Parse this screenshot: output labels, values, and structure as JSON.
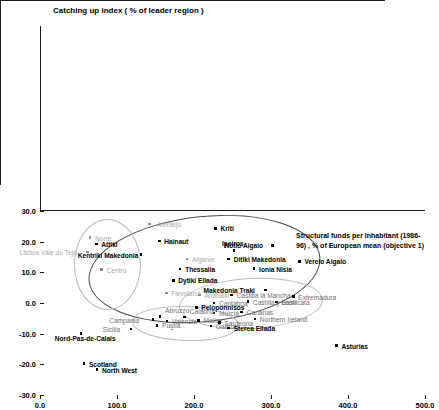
{
  "chart_data": {
    "type": "scatter",
    "title": "Catching up index ( % of leader region )",
    "xlabel": "Structural funds per inhabitant (1986-96) , % of European mean (objective 1)",
    "ylabel": "Catching up index ( % of leader region )",
    "xlim": [
      0,
      500
    ],
    "ylim": [
      -30,
      30
    ],
    "xticks": [
      "0.0",
      "100.0",
      "200.0",
      "300.0",
      "400.0",
      "500.0"
    ],
    "xtick_values": [
      0,
      100,
      200,
      300,
      400,
      500
    ],
    "yticks": [
      "30.0",
      "20.0",
      "10.0",
      "0.0",
      "-10.0",
      "-20.0",
      "-30.0"
    ],
    "ytick_values": [
      30,
      20,
      10,
      0,
      -10,
      -20,
      -30
    ],
    "grid": false,
    "legend": "none",
    "points": [
      {
        "label": "Alentejo",
        "x": 142,
        "y": 25.8,
        "style": "dim",
        "lx": 8,
        "ly": -3
      },
      {
        "label": "Kriti",
        "x": 228,
        "y": 24.3,
        "style": "dark",
        "lx": 5,
        "ly": -3
      },
      {
        "label": "Norte",
        "x": 65,
        "y": 21.3,
        "style": "dim",
        "lx": 5,
        "ly": -3
      },
      {
        "label": "Attiki",
        "x": 73,
        "y": 19.3,
        "style": "dark",
        "lx": 5,
        "ly": -3
      },
      {
        "label": "Hainaut",
        "x": 155,
        "y": 20.2,
        "style": "dark",
        "lx": 5,
        "ly": -3
      },
      {
        "label": "Ipeiros",
        "x": 252,
        "y": 17.2,
        "style": "dark",
        "lx": -12,
        "ly": -10
      },
      {
        "label": "Notio Aigaio",
        "x": 302,
        "y": 18.8,
        "style": "dark",
        "lx": -48,
        "ly": -3
      },
      {
        "label": "Lisboa Vale do Tejo",
        "x": 62,
        "y": 16.6,
        "style": "dim",
        "lx": -68,
        "ly": -3
      },
      {
        "label": "Kentriki Makedonia",
        "x": 131,
        "y": 15.8,
        "style": "dark",
        "lx": -63,
        "ly": -3
      },
      {
        "label": "Algarve",
        "x": 191,
        "y": 14.4,
        "style": "dim",
        "lx": 5,
        "ly": -3
      },
      {
        "label": "Ditiki Makedonia",
        "x": 245,
        "y": 14.4,
        "style": "dark",
        "lx": 5,
        "ly": -3
      },
      {
        "label": "Vereio Aigaio",
        "x": 337,
        "y": 13.6,
        "style": "dark",
        "lx": 5,
        "ly": -3
      },
      {
        "label": "Centro",
        "x": 80,
        "y": 10.9,
        "style": "dim",
        "lx": 5,
        "ly": -3
      },
      {
        "label": "Thessalia",
        "x": 182,
        "y": 11.1,
        "style": "dark",
        "lx": 5,
        "ly": -3
      },
      {
        "label": "Ionia Nisia",
        "x": 278,
        "y": 11.2,
        "style": "dark",
        "lx": 5,
        "ly": -3
      },
      {
        "label": "Dytiki Ellada",
        "x": 173,
        "y": 7.4,
        "style": "dark",
        "lx": 5,
        "ly": -3
      },
      {
        "label": "Makedonia Traki",
        "x": 293,
        "y": 4.3,
        "style": "dark",
        "lx": -62,
        "ly": -3
      },
      {
        "label": "Flevoland",
        "x": 164,
        "y": 3.3,
        "style": "dim",
        "lx": 5,
        "ly": -3
      },
      {
        "label": "Anatoliki",
        "x": 207,
        "y": 2.6,
        "style": "dim",
        "lx": 5,
        "ly": -3
      },
      {
        "label": "Castilla la Mancha",
        "x": 249,
        "y": 2.6,
        "style": "mid",
        "lx": 5,
        "ly": -3
      },
      {
        "label": "Extremadura",
        "x": 329,
        "y": 2.1,
        "style": "mid",
        "lx": 5,
        "ly": -3
      },
      {
        "label": "Basilicata",
        "x": 307,
        "y": 0.3,
        "style": "mid",
        "lx": 5,
        "ly": -3
      },
      {
        "label": "Cantabria",
        "x": 226,
        "y": 0.0,
        "style": "mid",
        "lx": 5,
        "ly": -3
      },
      {
        "label": "Castilla y Leon",
        "x": 270,
        "y": 0.4,
        "style": "mid",
        "lx": 5,
        "ly": -3
      },
      {
        "label": "Peloponnisos",
        "x": 203,
        "y": -1.4,
        "style": "dark",
        "lx": 5,
        "ly": -3
      },
      {
        "label": "Murcia",
        "x": 226,
        "y": -3.3,
        "style": "mid",
        "lx": 5,
        "ly": -3
      },
      {
        "label": "Canarias",
        "x": 262,
        "y": -2.9,
        "style": "mid",
        "lx": 5,
        "ly": -3
      },
      {
        "label": "Campania",
        "x": 147,
        "y": -5.4,
        "style": "mid",
        "lx": -44,
        "ly": -3
      },
      {
        "label": "Abruzzo",
        "x": 156,
        "y": -4.4,
        "style": "mid",
        "lx": 5,
        "ly": -9
      },
      {
        "label": "Calabria",
        "x": 188,
        "y": -4.6,
        "style": "mid",
        "lx": 5,
        "ly": -9
      },
      {
        "label": "Valencia",
        "x": 165,
        "y": -5.9,
        "style": "mid",
        "lx": 5,
        "ly": -3
      },
      {
        "label": "Molise",
        "x": 206,
        "y": -5.7,
        "style": "mid",
        "lx": 5,
        "ly": -3
      },
      {
        "label": "Puglia",
        "x": 152,
        "y": -7.3,
        "style": "mid",
        "lx": 5,
        "ly": -3
      },
      {
        "label": "Galicia",
        "x": 222,
        "y": -7.5,
        "style": "mid",
        "lx": 5,
        "ly": -3
      },
      {
        "label": "Sterea Ellada",
        "x": 245,
        "y": -8.1,
        "style": "dark",
        "lx": 5,
        "ly": -3
      },
      {
        "label": "Sardegna",
        "x": 233,
        "y": -6.4,
        "style": "mid",
        "lx": 5,
        "ly": -3
      },
      {
        "label": "Northern Ireland",
        "x": 279,
        "y": -5.2,
        "style": "mid",
        "lx": 5,
        "ly": -3
      },
      {
        "label": "Sicilia",
        "x": 118,
        "y": -8.5,
        "style": "mid",
        "lx": -28,
        "ly": -3
      },
      {
        "label": "Nord-Pas-de-Calais",
        "x": 53,
        "y": -9.9,
        "style": "dark",
        "lx": -26,
        "ly": 2
      },
      {
        "label": "Asturias",
        "x": 385,
        "y": -13.9,
        "style": "dark",
        "lx": 5,
        "ly": -3
      },
      {
        "label": "Scotland",
        "x": 57,
        "y": -19.8,
        "style": "dark",
        "lx": 5,
        "ly": -3
      },
      {
        "label": "North West",
        "x": 74,
        "y": -21.7,
        "style": "dark",
        "lx": 5,
        "ly": -3
      }
    ],
    "ellipses": [
      {
        "name": "greek-outer-ellipse",
        "cx": 212,
        "cy": 11.5,
        "rx": 150,
        "ry": 17.0,
        "rot": -6,
        "shade": "dark"
      },
      {
        "name": "portugal-ellipse",
        "cx": 86,
        "cy": 13.0,
        "rx": 42,
        "ry": 14.5,
        "rot": 0,
        "shade": "light"
      },
      {
        "name": "spain-ellipse",
        "cx": 272,
        "cy": 0.0,
        "rx": 92,
        "ry": 8.0,
        "rot": -3,
        "shade": "light"
      },
      {
        "name": "italy-ellipse",
        "cx": 188,
        "cy": -6.3,
        "rx": 68,
        "ry": 5.4,
        "rot": 2,
        "shade": "light"
      }
    ]
  }
}
